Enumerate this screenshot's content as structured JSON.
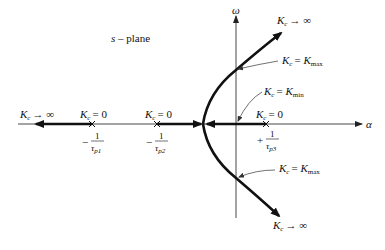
{
  "diagram": {
    "title": "s – plane",
    "plane_label_var": "s",
    "plane_label_rest": " – plane",
    "axes": {
      "real_label": "α",
      "imag_label": "ω"
    },
    "gain_symbol": "K",
    "gain_sub": "c",
    "labels": {
      "left_infinity": "→ ∞",
      "p1_zero": "= 0",
      "p2_zero": "= 0",
      "p3_zero": "= 0",
      "upper_infinity": "→ ∞",
      "lower_infinity": "→ ∞",
      "upper_kmax_eq": "= ",
      "upper_kmax": "K",
      "upper_kmax_sub": "max",
      "kmin_eq": "= ",
      "kmin": "K",
      "kmin_sub": "min",
      "lower_kmax_eq": "= ",
      "lower_kmax": "K",
      "lower_kmax_sub": "max"
    },
    "poles": [
      {
        "id": "p1",
        "sign": "−",
        "numerator": "1",
        "tau": "τ",
        "sub": "p1"
      },
      {
        "id": "p2",
        "sign": "−",
        "numerator": "1",
        "tau": "τ",
        "sub": "p2"
      },
      {
        "id": "p3",
        "sign": "+",
        "numerator": "1",
        "tau": "τ",
        "sub": "p3"
      }
    ],
    "colors": {
      "line": "#111111",
      "axis": "#333333",
      "background": "#ffffff"
    }
  }
}
